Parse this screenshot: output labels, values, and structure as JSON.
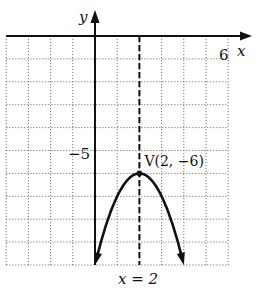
{
  "chart_data": {
    "type": "line",
    "title": "",
    "xlabel": "x",
    "ylabel": "y",
    "xlim": [
      -4,
      6
    ],
    "ylim": [
      -10,
      0
    ],
    "grid": true,
    "x_tick_labels": [
      {
        "value": 6,
        "label": "6"
      }
    ],
    "y_tick_labels": [
      {
        "value": -5,
        "label": "−5"
      }
    ],
    "series": [
      {
        "name": "parabola",
        "equation": "y = -(x-2)^2 - 6",
        "points": [
          [
            0,
            -10
          ],
          [
            0.5,
            -8.25
          ],
          [
            1,
            -7
          ],
          [
            1.5,
            -6.25
          ],
          [
            2,
            -6
          ],
          [
            2.5,
            -6.25
          ],
          [
            3,
            -7
          ],
          [
            3.5,
            -8.25
          ],
          [
            4,
            -10
          ]
        ],
        "arrows_at_ends": true
      }
    ],
    "vertex": {
      "x": 2,
      "y": -6,
      "label": "V(2, −6)"
    },
    "axis_of_symmetry": {
      "x": 2,
      "label": "x = 2",
      "style": "dashed"
    }
  }
}
